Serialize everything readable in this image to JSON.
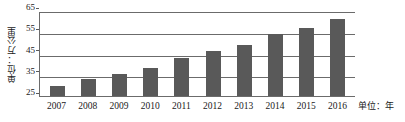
{
  "chart_data": {
    "type": "bar",
    "title": "",
    "subtitle": "",
    "categories": [
      "2007",
      "2008",
      "2009",
      "2010",
      "2011",
      "2012",
      "2013",
      "2014",
      "2015",
      "2016"
    ],
    "values": [
      30,
      33,
      35.5,
      38.5,
      43.5,
      46.5,
      49.5,
      55,
      58,
      62
    ],
    "series": [
      {
        "name": "",
        "values": [
          30,
          33,
          35.5,
          38.5,
          43.5,
          46.5,
          49.5,
          55,
          58,
          62
        ],
        "color": "#595959"
      }
    ],
    "xlabel": "单位：年",
    "ylabel": "单位：万公里",
    "ylim": [
      25,
      65
    ],
    "yticks": [
      25,
      35,
      45,
      55,
      65
    ],
    "ytick_labels": [
      "25",
      "35",
      "45",
      "55",
      "65"
    ],
    "xtick_labels": [
      "2007",
      "2008",
      "2009",
      "2010",
      "2011",
      "2012",
      "2013",
      "2014",
      "2015",
      "2016"
    ],
    "grid": true,
    "grid_axis": "y",
    "legend": false,
    "legend_position": "none",
    "annotations": [],
    "colors": {
      "bar": "#595959",
      "axis": "#6b6b6b",
      "grid": "#6b6b6b",
      "text": "#1a1a1a",
      "background": "#ffffff"
    }
  },
  "axes": {
    "y_title": "单位：万公里",
    "x_unit_note": "单位：年"
  }
}
